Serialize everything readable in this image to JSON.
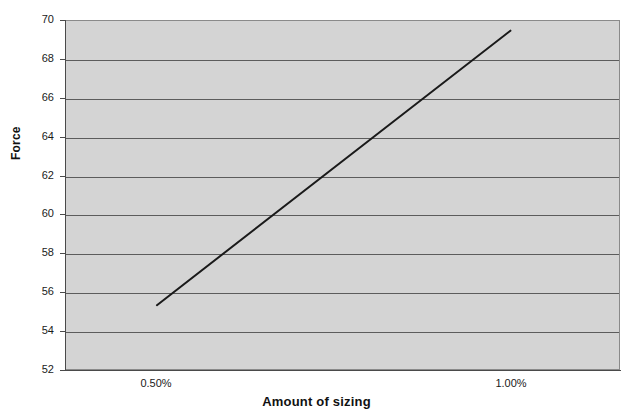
{
  "chart_data": {
    "type": "line",
    "title": "",
    "subtitle": "",
    "xlabel": "Amount of sizing",
    "ylabel": "Force",
    "x": [
      0.5,
      1.0
    ],
    "x_tick_labels": [
      "0.50%",
      "1.00%"
    ],
    "categories": [
      "0.50%",
      "1.00%"
    ],
    "xlim": [
      0.3714,
      1.1536
    ],
    "ylim": [
      52,
      70
    ],
    "y_ticks": [
      52,
      54,
      56,
      58,
      60,
      62,
      64,
      66,
      68,
      70
    ],
    "y_tick_labels": [
      "52",
      "54",
      "56",
      "58",
      "60",
      "62",
      "64",
      "66",
      "68",
      "70"
    ],
    "grid": "horizontal",
    "legend": "none",
    "series": [
      {
        "name": "Force",
        "values": [
          55.3,
          69.5
        ],
        "points": [
          {
            "x": 0.5,
            "y": 55.3
          },
          {
            "x": 1.0,
            "y": 69.5
          }
        ],
        "color": "#1a1a1a",
        "line_width": 2
      }
    ],
    "annotations": [],
    "plot_background": "#d4d4d4",
    "gridline_color": "#5c5c5c",
    "axis_color": "#4a4a4a",
    "figure_background": "#ffffff"
  },
  "axes": {
    "y_title": "Force",
    "x_title": "Amount of sizing"
  }
}
